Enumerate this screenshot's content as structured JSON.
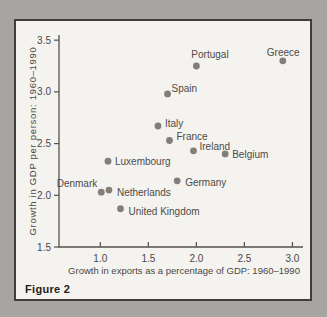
{
  "figure": {
    "caption": "Figure 2"
  },
  "chart_data": {
    "type": "scatter",
    "title": "",
    "xlabel": "Growth in exports as a percentage of GDP: 1960–1990",
    "ylabel": "Growth in GDP per person: 1960–1990",
    "xlim": [
      0.57,
      3.11
    ],
    "ylim": [
      1.5,
      3.55
    ],
    "grid": false,
    "legend": "none",
    "x_ticks": [
      {
        "v": 1.0,
        "label": "1.0"
      },
      {
        "v": 1.5,
        "label": "1.5"
      },
      {
        "v": 2.0,
        "label": "2.0"
      },
      {
        "v": 2.5,
        "label": "2.5"
      },
      {
        "v": 3.0,
        "label": "3.0"
      }
    ],
    "y_ticks": [
      {
        "v": 1.5,
        "label": "1.5"
      },
      {
        "v": 2.0,
        "label": "2.0"
      },
      {
        "v": 2.5,
        "label": "2.5"
      },
      {
        "v": 3.0,
        "label": "3.0"
      },
      {
        "v": 3.5,
        "label": "3.5"
      }
    ],
    "points": [
      {
        "name": "Portugal",
        "x": 2.0,
        "y": 3.25,
        "dx": -5,
        "dy": -8,
        "anchor": "start"
      },
      {
        "name": "Greece",
        "x": 2.9,
        "y": 3.3,
        "dx": -16,
        "dy": -5,
        "anchor": "start"
      },
      {
        "name": "Spain",
        "x": 1.7,
        "y": 2.98,
        "dx": 4,
        "dy": -2,
        "anchor": "start"
      },
      {
        "name": "Italy",
        "x": 1.6,
        "y": 2.67,
        "dx": 7,
        "dy": 1,
        "anchor": "start"
      },
      {
        "name": "France",
        "x": 1.72,
        "y": 2.53,
        "dx": 7,
        "dy": 0,
        "anchor": "start"
      },
      {
        "name": "Ireland",
        "x": 1.97,
        "y": 2.43,
        "dx": 6,
        "dy": -1,
        "anchor": "start"
      },
      {
        "name": "Belgium",
        "x": 2.3,
        "y": 2.4,
        "dx": 7,
        "dy": 4,
        "anchor": "start"
      },
      {
        "name": "Luxembourg",
        "x": 1.08,
        "y": 2.33,
        "dx": 7,
        "dy": 4,
        "anchor": "start"
      },
      {
        "name": "Denmark",
        "x": 1.01,
        "y": 2.03,
        "dx": -4,
        "dy": -5,
        "anchor": "end"
      },
      {
        "name": "Netherlands",
        "x": 1.09,
        "y": 2.05,
        "dx": 8,
        "dy": 6,
        "anchor": "start"
      },
      {
        "name": "Germany",
        "x": 1.8,
        "y": 2.14,
        "dx": 8,
        "dy": 5,
        "anchor": "start"
      },
      {
        "name": "United Kingdom",
        "x": 1.21,
        "y": 1.87,
        "dx": 8,
        "dy": 6,
        "anchor": "start"
      }
    ],
    "colors": {
      "dot": "#827e7a",
      "axis": "#55514c",
      "tick_text": "#4a4745",
      "label_text": "#4e4a46",
      "caption_text": "#232019",
      "card_bg": "#f5f3ef",
      "card_border": "#403d3a",
      "page_bg": "#a7a5a2"
    }
  }
}
